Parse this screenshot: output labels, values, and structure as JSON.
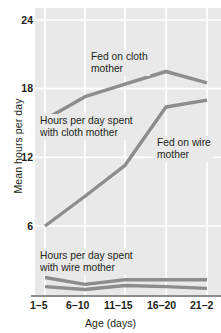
{
  "chart_data": {
    "type": "line",
    "title": "",
    "xlabel": "Age (days)",
    "ylabel": "Mean hours per day",
    "categories": [
      "1–5",
      "6–10",
      "11–15",
      "16–20",
      "21–2"
    ],
    "ytick_labels": [
      "24",
      "18",
      "12",
      "6"
    ],
    "ytick_values": [
      24,
      18,
      12,
      6
    ],
    "ylim": [
      0,
      25.2
    ],
    "grid": true,
    "legend": "annotations-inline",
    "line_color": "#8d8d8d",
    "plot_background": "#e9e9e9",
    "gridline_color": "#ffffff",
    "series": [
      {
        "name": "Hours per day spent with cloth mother",
        "values": [
          15.3,
          17.3,
          18.4,
          19.5,
          18.5
        ],
        "label_text": "Hours per day spent\nwith cloth mother"
      },
      {
        "name": "Fed on cloth mother",
        "values": [
          6.0,
          8.6,
          11.3,
          16.4,
          17.0
        ],
        "label_text": "Fed on cloth\nmother"
      },
      {
        "name": "Hours per day spent with wire mother",
        "values": [
          1.5,
          0.9,
          1.3,
          1.3,
          1.3
        ],
        "label_text": "Hours per day spent\nwith wire mother"
      },
      {
        "name": "Fed on wire mother",
        "values": [
          0.7,
          0.45,
          0.8,
          0.7,
          0.55
        ],
        "label_text": "Fed on wire\nmother"
      }
    ],
    "annotations": [
      {
        "name": "fed-on-cloth-mother",
        "text": "Fed on cloth\nmother"
      },
      {
        "name": "hours-with-cloth-mother",
        "text": "Hours per day spent\nwith cloth mother"
      },
      {
        "name": "fed-on-wire-mother",
        "text": "Fed on wire\nmother"
      },
      {
        "name": "hours-with-wire-mother",
        "text": "Hours per day spent\nwith wire mother"
      }
    ]
  },
  "axes": {
    "y": {
      "title": "Mean hours per day",
      "ticks": [
        {
          "label": "24"
        },
        {
          "label": "18"
        },
        {
          "label": "12"
        },
        {
          "label": "6"
        }
      ]
    },
    "x": {
      "title": "Age (days)",
      "ticks": [
        {
          "label": "1–5"
        },
        {
          "label": "6–10"
        },
        {
          "label": "11–15"
        },
        {
          "label": "16–20"
        },
        {
          "label": "21–2"
        }
      ]
    }
  },
  "annotations": {
    "fed_on_cloth_mother": "Fed on cloth\nmother",
    "hours_with_cloth_mother": "Hours per day spent\nwith cloth mother",
    "fed_on_wire_mother": "Fed on wire\nmother",
    "hours_with_wire_mother": "Hours per day spent\nwith wire mother"
  }
}
